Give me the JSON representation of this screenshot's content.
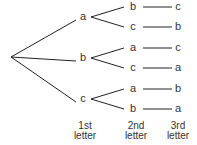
{
  "diagram": {
    "type": "tree",
    "root": {
      "x": 11,
      "y": 57
    },
    "level1": [
      {
        "label": "a",
        "x": 83,
        "y": 16
      },
      {
        "label": "b",
        "x": 83,
        "y": 57
      },
      {
        "label": "c",
        "x": 83,
        "y": 98
      }
    ],
    "level2": [
      {
        "label": "b",
        "parent": 0,
        "x": 133,
        "y": 6
      },
      {
        "label": "c",
        "parent": 0,
        "x": 133,
        "y": 26
      },
      {
        "label": "a",
        "parent": 1,
        "x": 133,
        "y": 47
      },
      {
        "label": "c",
        "parent": 1,
        "x": 133,
        "y": 67
      },
      {
        "label": "a",
        "parent": 2,
        "x": 133,
        "y": 88
      },
      {
        "label": "b",
        "parent": 2,
        "x": 133,
        "y": 108
      }
    ],
    "level3": [
      {
        "label": "c",
        "x": 178,
        "y": 6
      },
      {
        "label": "b",
        "x": 178,
        "y": 26
      },
      {
        "label": "c",
        "x": 178,
        "y": 47
      },
      {
        "label": "a",
        "x": 178,
        "y": 67
      },
      {
        "label": "b",
        "x": 178,
        "y": 88
      },
      {
        "label": "a",
        "x": 178,
        "y": 108
      }
    ],
    "column_labels": [
      {
        "line1": "1st",
        "line2": "letter",
        "x": 85
      },
      {
        "line1": "2nd",
        "line2": "letter",
        "x": 136
      },
      {
        "line1": "3rd",
        "line2": "letter",
        "x": 178
      }
    ],
    "line_color": "#222222",
    "text_color": "#333333"
  }
}
